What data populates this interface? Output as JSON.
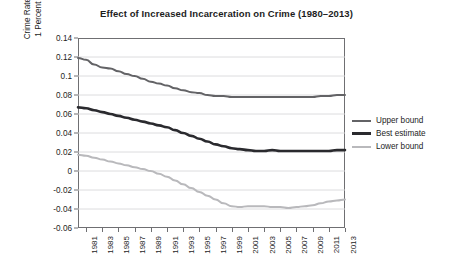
{
  "chart_data": {
    "type": "line",
    "title": "Effect of Increased Incarceration on Crime (1980–2013)",
    "xlabel": "",
    "ylabel": "Crime Rate Percent Decrease from a\n1 Percent Increase in Imprisonment",
    "ylim": [
      -0.06,
      0.14
    ],
    "xlim": [
      1980,
      2013
    ],
    "grid": true,
    "legend_position": "right",
    "ytick_labels": [
      "0.14",
      "0.12",
      "0.1",
      "0.08",
      "0.06",
      "0.04",
      "0.02",
      "0",
      "-0.02",
      "-0.04",
      "-0.06"
    ],
    "ytick_values": [
      0.14,
      0.12,
      0.1,
      0.08,
      0.06,
      0.04,
      0.02,
      0,
      -0.02,
      -0.04,
      -0.06
    ],
    "xtick_labels": [
      "1981",
      "1983",
      "1985",
      "1987",
      "1989",
      "1991",
      "1993",
      "1995",
      "1997",
      "1999",
      "2001",
      "2003",
      "2005",
      "2007",
      "2009",
      "2011",
      "2013"
    ],
    "xtick_values": [
      1981,
      1983,
      1985,
      1987,
      1989,
      1991,
      1993,
      1995,
      1997,
      1999,
      2001,
      2003,
      2005,
      2007,
      2009,
      2011,
      2013
    ],
    "x": [
      1980,
      1981,
      1982,
      1983,
      1984,
      1985,
      1986,
      1987,
      1988,
      1989,
      1990,
      1991,
      1992,
      1993,
      1994,
      1995,
      1996,
      1997,
      1998,
      1999,
      2000,
      2001,
      2002,
      2003,
      2004,
      2005,
      2006,
      2007,
      2008,
      2009,
      2010,
      2011,
      2012,
      2013
    ],
    "series": [
      {
        "name": "Upper bound",
        "color": "#636366",
        "width": 2.0,
        "values": [
          0.119,
          0.117,
          0.112,
          0.109,
          0.108,
          0.105,
          0.102,
          0.1,
          0.097,
          0.094,
          0.092,
          0.09,
          0.087,
          0.085,
          0.083,
          0.082,
          0.08,
          0.079,
          0.079,
          0.078,
          0.078,
          0.078,
          0.078,
          0.078,
          0.078,
          0.078,
          0.078,
          0.078,
          0.078,
          0.078,
          0.079,
          0.079,
          0.08,
          0.08
        ]
      },
      {
        "name": "Best estimate",
        "color": "#2a2a2e",
        "width": 2.6,
        "values": [
          0.067,
          0.066,
          0.064,
          0.062,
          0.06,
          0.058,
          0.056,
          0.054,
          0.052,
          0.05,
          0.048,
          0.046,
          0.043,
          0.04,
          0.037,
          0.034,
          0.031,
          0.028,
          0.026,
          0.024,
          0.023,
          0.022,
          0.021,
          0.021,
          0.022,
          0.021,
          0.021,
          0.021,
          0.021,
          0.021,
          0.021,
          0.021,
          0.022,
          0.022
        ]
      },
      {
        "name": "Lower bound",
        "color": "#b9b9bc",
        "width": 2.0,
        "values": [
          0.017,
          0.016,
          0.014,
          0.012,
          0.01,
          0.008,
          0.006,
          0.004,
          0.002,
          0.0,
          -0.003,
          -0.006,
          -0.01,
          -0.014,
          -0.018,
          -0.022,
          -0.026,
          -0.03,
          -0.034,
          -0.037,
          -0.038,
          -0.037,
          -0.037,
          -0.037,
          -0.038,
          -0.038,
          -0.039,
          -0.038,
          -0.037,
          -0.036,
          -0.034,
          -0.032,
          -0.031,
          -0.03
        ]
      }
    ]
  },
  "legend": {
    "items": [
      {
        "label": "Upper bound"
      },
      {
        "label": "Best estimate"
      },
      {
        "label": "Lower bound"
      }
    ]
  }
}
